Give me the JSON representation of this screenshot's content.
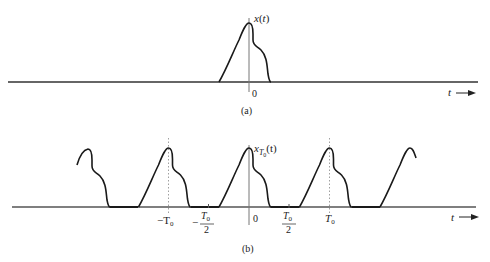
{
  "figure": {
    "panel_a": {
      "signal_label": "x(t)",
      "origin_label": "0",
      "axis_label": "t",
      "caption": "(a)"
    },
    "panel_b": {
      "signal_label_base": "x",
      "signal_label_sub": "T",
      "signal_label_subsub": "0",
      "signal_label_arg": "(t)",
      "origin_label": "0",
      "axis_label": "t",
      "tick_labels": {
        "neg_T0": "−T",
        "neg_T0_sub": "0",
        "neg_half_sign": "−",
        "neg_half_num": "T",
        "neg_half_num_sub": "0",
        "neg_half_den": "2",
        "pos_half_num": "T",
        "pos_half_num_sub": "0",
        "pos_half_den": "2",
        "T0": "T",
        "T0_sub": "0"
      },
      "caption": "(b)",
      "period_px": 80.5
    },
    "colors": {
      "curve": "#1a1a1a",
      "axis": "#555555",
      "dotted": "#888888"
    }
  }
}
